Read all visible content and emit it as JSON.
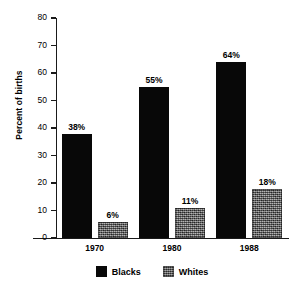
{
  "chart_data": {
    "type": "bar",
    "title": "",
    "subtitle": "",
    "xlabel": "",
    "ylabel": "Percent of births",
    "categories": [
      "1970",
      "1980",
      "1988"
    ],
    "series": [
      {
        "name": "Blacks",
        "values": [
          38,
          55,
          64
        ],
        "labels": [
          "38%",
          "55%",
          "64%"
        ],
        "color": "#080808",
        "fill": "solid-black"
      },
      {
        "name": "Whites",
        "values": [
          6,
          11,
          18
        ],
        "labels": [
          "6%",
          "11%",
          "18%"
        ],
        "color": "#5f5f5f",
        "fill": "dithered-gray"
      }
    ],
    "ylim": [
      0,
      80
    ],
    "ytick_values": [
      0,
      10,
      20,
      30,
      40,
      50,
      60,
      70,
      80
    ],
    "ytick_labels": [
      "0",
      "10",
      "20",
      "30",
      "40",
      "50",
      "60",
      "70",
      "80"
    ],
    "grid": false,
    "legend_position": "bottom-center",
    "legend_entries": [
      "Blacks",
      "Whites"
    ]
  },
  "axes": {
    "y_title": "Percent of births"
  },
  "legend": {
    "items": [
      {
        "label": "Blacks"
      },
      {
        "label": "Whites"
      }
    ]
  }
}
